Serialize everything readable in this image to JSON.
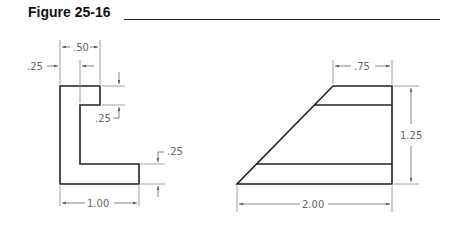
{
  "figure": {
    "title": "Figure 25-16"
  },
  "left_view": {
    "dims": {
      "top_width": ".50",
      "wall_thickness": ".25",
      "notch_height": ".25",
      "base_thickness": ".25",
      "overall_width": "1.00"
    }
  },
  "right_view": {
    "dims": {
      "top_width": ".75",
      "height": "1.25",
      "bottom_width": "2.00"
    }
  },
  "colors": {
    "object_line": "#222222",
    "dimension_line": "#777777",
    "dimension_text": "#666666"
  }
}
